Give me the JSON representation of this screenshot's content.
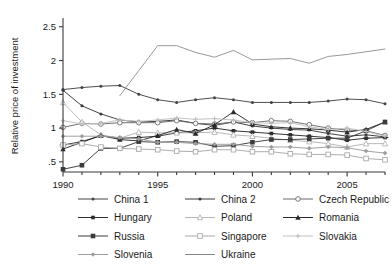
{
  "chart_data": {
    "type": "line",
    "title": "",
    "xlabel": "",
    "ylabel": "Relative price of investment",
    "xlim": [
      1990,
      2007
    ],
    "ylim": [
      0.35,
      2.6
    ],
    "grid": false,
    "legend_position": "bottom",
    "x_ticks": [
      "1990",
      "1995",
      "2000",
      "2005"
    ],
    "x_tick_values": [
      1990,
      1995,
      2000,
      2005
    ],
    "y_ticks": [
      ".5",
      "1",
      "1.5",
      "2",
      "2.5"
    ],
    "y_tick_values": [
      0.5,
      1,
      1.5,
      2,
      2.5
    ],
    "x": [
      1990,
      1991,
      1992,
      1993,
      1994,
      1995,
      1996,
      1997,
      1998,
      1999,
      2000,
      2001,
      2002,
      2003,
      2004,
      2005,
      2006,
      2007
    ],
    "series": [
      {
        "name": "China 1",
        "color": "#444444",
        "marker": "dot",
        "values": [
          1.57,
          1.6,
          1.62,
          1.63,
          1.5,
          1.42,
          1.38,
          1.42,
          1.45,
          1.42,
          1.38,
          1.38,
          1.38,
          1.38,
          1.4,
          1.43,
          1.42,
          1.36
        ]
      },
      {
        "name": "China 2",
        "color": "#3a3a3a",
        "marker": "dot",
        "values": [
          1.56,
          1.33,
          1.21,
          1.12,
          1.09,
          1.1,
          1.12,
          1.07,
          1.04,
          1.09,
          1.03,
          1.0,
          0.98,
          0.97,
          0.92,
          0.88,
          0.9,
          0.87
        ]
      },
      {
        "name": "Czech Republic",
        "color": "#6b6b6b",
        "marker": "circle-open",
        "values": [
          1.01,
          1.07,
          1.06,
          1.08,
          1.08,
          1.08,
          1.11,
          1.07,
          1.06,
          1.09,
          1.08,
          1.11,
          1.1,
          1.05,
          1.0,
          0.97,
          0.96,
          0.89
        ]
      },
      {
        "name": "Hungary",
        "color": "#2e2e2e",
        "marker": "x-filled",
        "values": [
          0.75,
          0.8,
          0.89,
          0.85,
          0.86,
          0.88,
          0.93,
          0.96,
          1.0,
          0.96,
          0.94,
          0.92,
          0.9,
          0.88,
          0.86,
          0.82,
          0.85,
          0.86
        ]
      },
      {
        "name": "Poland",
        "color": "#b5b5b5",
        "marker": "triangle-open",
        "values": [
          1.38,
          1.09,
          0.9,
          0.85,
          0.94,
          0.93,
          0.93,
          0.93,
          0.94,
          0.9,
          0.88,
          0.85,
          0.82,
          0.8,
          0.77,
          0.72,
          0.77,
          0.77
        ]
      },
      {
        "name": "Romania",
        "color": "#2a2a2a",
        "marker": "triangle-filled",
        "values": [
          0.69,
          0.79,
          0.89,
          0.83,
          0.81,
          0.89,
          0.98,
          0.92,
          1.05,
          1.24,
          1.06,
          1.02,
          1.0,
          0.99,
          0.97,
          0.94,
          0.98,
          1.09
        ]
      },
      {
        "name": "Russia",
        "color": "#3c3c3c",
        "marker": "square-filled",
        "values": [
          0.39,
          0.45,
          0.7,
          0.7,
          0.8,
          0.79,
          0.8,
          0.79,
          0.73,
          0.74,
          0.79,
          0.83,
          0.83,
          0.84,
          0.85,
          0.85,
          0.96,
          1.09
        ]
      },
      {
        "name": "Singapore",
        "color": "#a9a9a9",
        "marker": "square-open",
        "values": [
          0.75,
          0.77,
          0.72,
          0.7,
          0.69,
          0.68,
          0.66,
          0.65,
          0.68,
          0.68,
          0.65,
          0.65,
          0.62,
          0.61,
          0.61,
          0.6,
          0.55,
          0.53
        ]
      },
      {
        "name": "Slovakia",
        "color": "#c0c0c0",
        "marker": "plus",
        "values": [
          1.11,
          1.06,
          1.07,
          1.12,
          1.1,
          1.12,
          1.15,
          1.13,
          1.14,
          1.12,
          1.08,
          1.07,
          1.08,
          1.02,
          0.98,
          1.0,
          0.95,
          0.88
        ]
      },
      {
        "name": "Slovenia",
        "color": "#9c9c9c",
        "marker": "diamond",
        "values": [
          0.88,
          0.88,
          0.88,
          0.86,
          0.84,
          0.79,
          0.79,
          0.77,
          0.76,
          0.76,
          0.73,
          0.72,
          0.72,
          0.7,
          0.72,
          0.71,
          0.66,
          0.63
        ]
      },
      {
        "name": "Ukraine",
        "color": "#858585",
        "marker": "none",
        "start_index": 3,
        "values": [
          null,
          null,
          null,
          1.48,
          1.85,
          2.22,
          2.22,
          2.12,
          2.05,
          2.15,
          2.01,
          2.02,
          2.03,
          1.96,
          2.06,
          2.09,
          2.13,
          2.17
        ]
      }
    ]
  },
  "legend": {
    "rows": [
      [
        {
          "label": "China 1",
          "series": 0
        },
        {
          "label": "China 2",
          "series": 1
        },
        {
          "label": "Czech Republic",
          "series": 2
        }
      ],
      [
        {
          "label": "Hungary",
          "series": 3
        },
        {
          "label": "Poland",
          "series": 4
        },
        {
          "label": "Romania",
          "series": 5
        }
      ],
      [
        {
          "label": "Russia",
          "series": 6
        },
        {
          "label": "Singapore",
          "series": 7
        },
        {
          "label": "Slovakia",
          "series": 8
        }
      ],
      [
        {
          "label": "Slovenia",
          "series": 9
        },
        {
          "label": "Ukraine",
          "series": 10
        }
      ]
    ]
  }
}
